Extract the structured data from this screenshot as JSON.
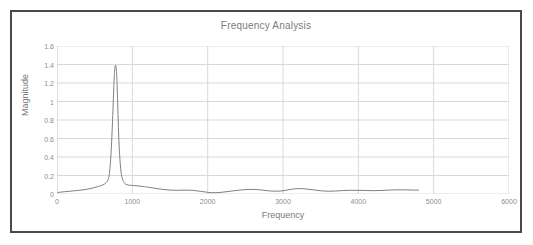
{
  "chart_data": {
    "type": "line",
    "title": "Frequency Analysis",
    "xlabel": "Frequency",
    "ylabel": "Magnitude",
    "xlim": [
      0,
      6000
    ],
    "ylim": [
      0,
      1.6
    ],
    "xticks": [
      0,
      1000,
      2000,
      3000,
      4000,
      5000,
      6000
    ],
    "xtick_labels": [
      "0",
      "1000",
      "2000",
      "3000",
      "4000",
      "5000",
      "6000"
    ],
    "yticks": [
      0,
      0.2,
      0.4,
      0.6,
      0.8,
      1,
      1.2,
      1.4,
      1.6
    ],
    "ytick_labels": [
      "0",
      "0.2",
      "0.4",
      "0.6",
      "0.8",
      "1",
      "1.2",
      "1.4",
      "1.6"
    ],
    "grid": {
      "horizontal": true,
      "vertical": true
    },
    "legend": null,
    "line_color": "#808080",
    "grid_color": "#d9d9d9",
    "series": [
      {
        "name": "Magnitude",
        "x": [
          0,
          50,
          100,
          150,
          200,
          250,
          300,
          350,
          400,
          450,
          500,
          550,
          600,
          650,
          680,
          700,
          720,
          740,
          755,
          765,
          775,
          785,
          795,
          805,
          815,
          830,
          850,
          870,
          900,
          930,
          960,
          1000,
          1050,
          1100,
          1150,
          1200,
          1300,
          1400,
          1500,
          1600,
          1700,
          1800,
          1900,
          2000,
          2100,
          2200,
          2300,
          2400,
          2500,
          2600,
          2700,
          2800,
          2900,
          3000,
          3100,
          3200,
          3300,
          3400,
          3500,
          3600,
          3700,
          3800,
          3900,
          4000,
          4100,
          4200,
          4300,
          4400,
          4500,
          4600,
          4700,
          4800
        ],
        "y": [
          0.015,
          0.02,
          0.025,
          0.028,
          0.032,
          0.036,
          0.04,
          0.045,
          0.052,
          0.06,
          0.07,
          0.082,
          0.095,
          0.12,
          0.16,
          0.25,
          0.48,
          0.85,
          1.18,
          1.33,
          1.39,
          1.37,
          1.25,
          1.0,
          0.72,
          0.44,
          0.24,
          0.16,
          0.115,
          0.1,
          0.095,
          0.093,
          0.09,
          0.085,
          0.08,
          0.075,
          0.062,
          0.05,
          0.042,
          0.04,
          0.042,
          0.04,
          0.03,
          0.018,
          0.014,
          0.02,
          0.03,
          0.04,
          0.048,
          0.05,
          0.045,
          0.035,
          0.03,
          0.035,
          0.05,
          0.058,
          0.055,
          0.045,
          0.035,
          0.03,
          0.032,
          0.038,
          0.04,
          0.04,
          0.038,
          0.036,
          0.038,
          0.042,
          0.045,
          0.045,
          0.043,
          0.042
        ]
      }
    ],
    "annotations": {
      "peak_frequency": 775,
      "peak_magnitude": 1.39
    }
  }
}
